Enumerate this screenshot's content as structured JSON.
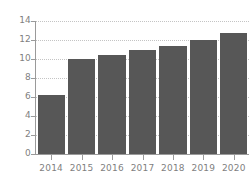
{
  "chart_data": {
    "type": "bar",
    "title": "",
    "subtitle": "",
    "xlabel": "",
    "ylabel": "",
    "categories": [
      "2014",
      "2015",
      "2016",
      "2017",
      "2018",
      "2019",
      "2020"
    ],
    "values": [
      6.2,
      10.0,
      10.4,
      10.9,
      11.4,
      12.0,
      12.7
    ],
    "series": [
      {
        "name": "",
        "values": [
          6.2,
          10.0,
          10.4,
          10.9,
          11.4,
          12.0,
          12.7
        ]
      }
    ],
    "ylim": [
      0,
      14
    ],
    "ytick_labels": [
      "0",
      "2",
      "4",
      "6",
      "8",
      "10",
      "12",
      "14"
    ],
    "ytick_values": [
      0,
      2,
      4,
      6,
      8,
      10,
      12,
      14
    ],
    "xtick_labels": [
      "2014",
      "2015",
      "2016",
      "2017",
      "2018",
      "2019",
      "2020"
    ],
    "grid": true,
    "grid_axis": "y",
    "grid_style": "dotted",
    "legend": false,
    "legend_position": "none",
    "bar_color": "#575757",
    "grid_color": "#c4c4c4",
    "axis_color": "#9a9a9a",
    "tick_label_color": "#7f7f7f",
    "background_color": "#ffffff"
  }
}
